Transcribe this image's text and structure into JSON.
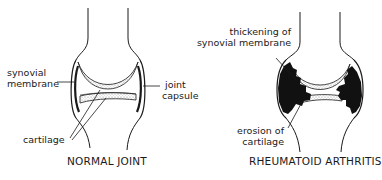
{
  "diagram": {
    "panels": [
      {
        "id": "normal",
        "title": "NORMAL JOINT",
        "labels": {
          "synovial_membrane": [
            "synovial",
            "membrane"
          ],
          "joint_capsule": [
            "joint",
            "capsule"
          ],
          "cartilage": "cartilage"
        }
      },
      {
        "id": "rheumatoid",
        "title": "RHEUMATOID ARTHRITIS",
        "labels": {
          "thickening": [
            "thickening of",
            "synovial membrane"
          ],
          "erosion": [
            "erosion of",
            "cartilage"
          ]
        }
      }
    ],
    "colors": {
      "line": "#1a1a1a",
      "background": "#ffffff",
      "cartilage_stipple": "#bdbdbd",
      "inflamed_tissue": "#111111"
    }
  }
}
